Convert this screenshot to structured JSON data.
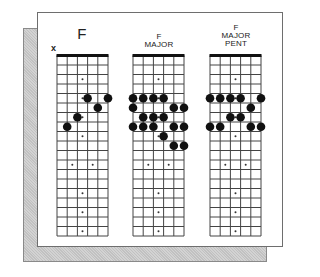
{
  "frame": {
    "card_color": "#ffffff",
    "shadow_color": "#c9c9c9",
    "line_color": "#444444",
    "dot_color": "#111111"
  },
  "fretboard_spec": {
    "strings": 6,
    "frets": 19,
    "inlay_frets_single": [
      3,
      5,
      7,
      9,
      15,
      17,
      19
    ],
    "inlay_frets_double": [
      12
    ]
  },
  "diagrams": [
    {
      "title_lines": [
        "F"
      ],
      "title_size": "large",
      "muted_strings": [
        1
      ],
      "muted_label": "x",
      "dots": [
        {
          "string": 4,
          "fret": 5
        },
        {
          "string": 6,
          "fret": 5
        },
        {
          "string": 5,
          "fret": 6
        },
        {
          "string": 3,
          "fret": 7
        },
        {
          "string": 2,
          "fret": 8
        }
      ]
    },
    {
      "title_lines": [
        "F",
        "MAJOR"
      ],
      "title_size": "small",
      "muted_strings": [],
      "dots": [
        {
          "string": 1,
          "fret": 5
        },
        {
          "string": 2,
          "fret": 5
        },
        {
          "string": 3,
          "fret": 5
        },
        {
          "string": 4,
          "fret": 5
        },
        {
          "string": 1,
          "fret": 6
        },
        {
          "string": 5,
          "fret": 6
        },
        {
          "string": 6,
          "fret": 6
        },
        {
          "string": 2,
          "fret": 7
        },
        {
          "string": 3,
          "fret": 7
        },
        {
          "string": 4,
          "fret": 7
        },
        {
          "string": 1,
          "fret": 8
        },
        {
          "string": 2,
          "fret": 8
        },
        {
          "string": 3,
          "fret": 8
        },
        {
          "string": 5,
          "fret": 8
        },
        {
          "string": 6,
          "fret": 8
        },
        {
          "string": 4,
          "fret": 9
        },
        {
          "string": 5,
          "fret": 10
        },
        {
          "string": 6,
          "fret": 10
        }
      ]
    },
    {
      "title_lines": [
        "F",
        "MAJOR",
        "PENT"
      ],
      "title_size": "small",
      "muted_strings": [],
      "dots": [
        {
          "string": 1,
          "fret": 5
        },
        {
          "string": 2,
          "fret": 5
        },
        {
          "string": 3,
          "fret": 5
        },
        {
          "string": 4,
          "fret": 5
        },
        {
          "string": 6,
          "fret": 5
        },
        {
          "string": 5,
          "fret": 6
        },
        {
          "string": 3,
          "fret": 7
        },
        {
          "string": 4,
          "fret": 7
        },
        {
          "string": 1,
          "fret": 8
        },
        {
          "string": 2,
          "fret": 8
        },
        {
          "string": 5,
          "fret": 8
        },
        {
          "string": 6,
          "fret": 8
        }
      ]
    }
  ]
}
